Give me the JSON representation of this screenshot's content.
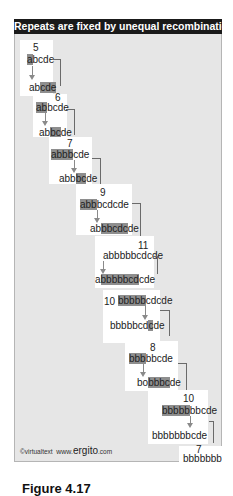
{
  "title": "Repeats are fixed by unequal recombination",
  "panels": [
    {
      "count": "5",
      "top": {
        "hl": "a",
        "rest": "bcde"
      },
      "bottom": {
        "pre": "ab",
        "hl": "cde",
        "post": ""
      }
    },
    {
      "count": "6",
      "top": {
        "hl": "ab",
        "rest": "bcde"
      },
      "bottom": {
        "pre": "ab",
        "hl": "bc",
        "post": "de"
      }
    },
    {
      "count": "7",
      "top": {
        "hl": "abbb",
        "rest": "cde"
      },
      "bottom": {
        "pre": "abb",
        "hl": "bc",
        "post": "de"
      }
    },
    {
      "count": "9",
      "top": {
        "hl": "abb",
        "rest": "bcdcde"
      },
      "bottom": {
        "pre": "ab",
        "hl": "bbcdc",
        "post": "de"
      }
    },
    {
      "count": "11",
      "top": {
        "hl": "",
        "rest": "abbbbbcdcde"
      },
      "bottom": {
        "pre": "a",
        "hl": "bbbbbcd",
        "post": "cde"
      }
    },
    {
      "count": "10",
      "top": {
        "hl": "bbbbb",
        "rest": "cdcde"
      },
      "bottom": {
        "pre": "bbbbbcd",
        "hl": "c",
        "post": "de"
      }
    },
    {
      "count": "8",
      "top": {
        "hl": "bbb",
        "rest": "bbcde"
      },
      "bottom": {
        "pre": "bo",
        "hl": "bbbc",
        "post": "de"
      }
    },
    {
      "count": "10",
      "top": {
        "hl": "bbbbb",
        "rest": "bbcde"
      },
      "bottom": {
        "pre": "bbbbbbbc",
        "hl": "",
        "post": "de"
      }
    },
    {
      "count": "7",
      "top": {
        "hl": "",
        "rest": "bbbbbbb"
      },
      "bottom": {
        "pre": "",
        "hl": "",
        "post": ""
      }
    }
  ],
  "footer": {
    "copyright": "©virtualtext",
    "www": "www.",
    "brand": "ergito",
    "domain": ".com"
  },
  "caption": {
    "figure": "Figure 4.17",
    "rest": ""
  },
  "colors": {
    "header_bg": "#1a1a1a",
    "frame_bg": "#e6e6e6",
    "highlight": "#8e8e8e",
    "panel_bg": "#ffffff"
  }
}
